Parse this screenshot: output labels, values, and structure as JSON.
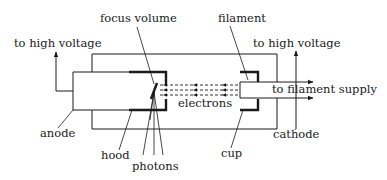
{
  "diagram": {
    "labels": {
      "focus_volume": "focus volume",
      "filament": "filament",
      "high_voltage_left": "to high voltage",
      "high_voltage_right": "to high voltage",
      "filament_supply": "to filament supply",
      "electrons": "electrons",
      "anode": "anode",
      "cathode": "cathode",
      "hood": "hood",
      "cup": "cup",
      "photons": "photons"
    },
    "colors": {
      "line": "#1a1a1a",
      "background": "#ffffff"
    }
  }
}
